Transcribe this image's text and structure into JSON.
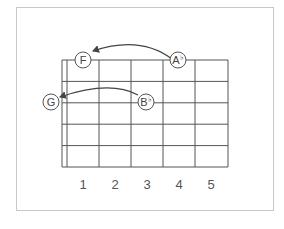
{
  "diagram": {
    "type": "guitar-fretboard",
    "strings": 6,
    "frets": 5,
    "fret_labels": [
      "1",
      "2",
      "3",
      "4",
      "5"
    ],
    "notes": [
      {
        "id": "note-f",
        "name": "F",
        "accidental": ""
      },
      {
        "id": "note-a-flat",
        "name": "A",
        "accidental": "♭"
      },
      {
        "id": "note-g",
        "name": "G",
        "accidental": ""
      },
      {
        "id": "note-b-flat",
        "name": "B",
        "accidental": "♭"
      }
    ],
    "arrows": [
      {
        "from": "A♭",
        "to": "F"
      },
      {
        "from": "B♭",
        "to": "G"
      }
    ],
    "colors": {
      "line": "#555555",
      "border": "#c8c8c8",
      "background": "#ffffff"
    }
  }
}
